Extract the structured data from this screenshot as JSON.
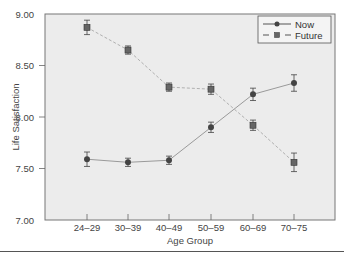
{
  "chart_data": {
    "type": "line",
    "title": "",
    "xlabel": "Age Group",
    "ylabel": "Life Satisfaction",
    "categories": [
      "24–29",
      "30–39",
      "40–49",
      "50–59",
      "60–69",
      "70–75"
    ],
    "yticks": [
      "7.00",
      "7.50",
      "8.00",
      "8.50",
      "9.00"
    ],
    "ylim": [
      7.0,
      9.0
    ],
    "grid": false,
    "legend_position": "upper right",
    "error_bars": true,
    "series": [
      {
        "name": "Now",
        "style": "solid",
        "marker": "circle",
        "values": [
          7.59,
          7.56,
          7.58,
          7.9,
          8.22,
          8.33
        ],
        "errors": [
          0.07,
          0.04,
          0.04,
          0.05,
          0.06,
          0.08
        ]
      },
      {
        "name": "Future",
        "style": "dashed",
        "marker": "square",
        "values": [
          8.87,
          8.65,
          8.29,
          8.27,
          7.92,
          7.56
        ],
        "errors": [
          0.07,
          0.04,
          0.04,
          0.05,
          0.05,
          0.09
        ]
      }
    ]
  },
  "colors": {
    "plot_bg": "#ececec",
    "frame": "#777777",
    "now_line": "#9a9a9a",
    "future_line": "#b0b0b0",
    "marker": "#444444"
  }
}
